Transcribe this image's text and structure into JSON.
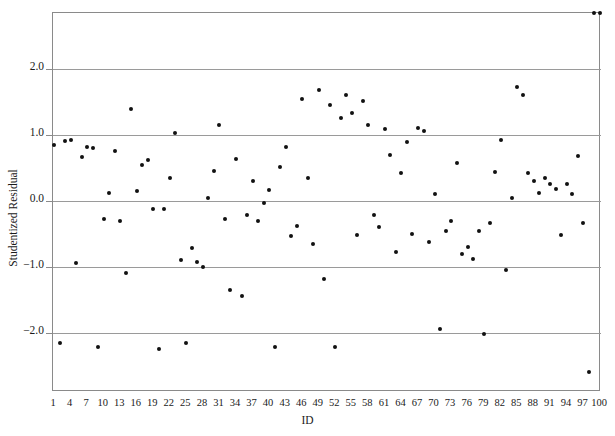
{
  "chart_data": {
    "type": "scatter",
    "title": "",
    "xlabel": "ID",
    "ylabel": "Studentized Residual",
    "xlim": [
      1,
      100
    ],
    "ylim": [
      -2.9,
      2.85
    ],
    "grid": true,
    "gridlines_y": [
      2.0,
      1.0,
      0.0,
      -1.0,
      -2.0
    ],
    "legend": "none",
    "xticks": [
      1,
      4,
      7,
      10,
      13,
      16,
      19,
      22,
      25,
      28,
      31,
      34,
      37,
      40,
      43,
      46,
      49,
      52,
      55,
      58,
      61,
      64,
      67,
      70,
      73,
      76,
      79,
      82,
      85,
      88,
      91,
      94,
      97,
      100
    ],
    "yticks": [
      2.0,
      1.0,
      0.0,
      -1.0,
      -2.0
    ],
    "ytick_labels": [
      "2.0",
      "1.0",
      "0.0",
      "−1.0",
      "−2.0"
    ],
    "marker": "filled-circle",
    "marker_color": "#111111",
    "x": [
      1,
      2,
      3,
      4,
      5,
      6,
      7,
      8,
      9,
      10,
      11,
      12,
      13,
      14,
      15,
      16,
      17,
      18,
      19,
      20,
      21,
      22,
      23,
      24,
      25,
      26,
      27,
      28,
      29,
      30,
      31,
      32,
      33,
      34,
      35,
      36,
      37,
      38,
      39,
      40,
      41,
      42,
      43,
      44,
      45,
      46,
      47,
      48,
      49,
      50,
      51,
      52,
      53,
      54,
      55,
      56,
      57,
      58,
      59,
      60,
      61,
      62,
      63,
      64,
      65,
      66,
      67,
      68,
      69,
      70,
      71,
      72,
      73,
      74,
      75,
      76,
      77,
      78,
      79,
      80,
      81,
      82,
      83,
      84,
      85,
      86,
      87,
      88,
      89,
      90,
      91,
      92,
      93,
      94,
      95,
      96,
      97,
      98,
      99,
      100
    ],
    "y": [
      0.85,
      -2.15,
      0.91,
      0.93,
      -0.95,
      0.66,
      0.82,
      0.8,
      -2.22,
      -0.28,
      0.12,
      0.75,
      -0.3,
      -1.1,
      1.4,
      0.15,
      0.55,
      0.62,
      -0.13,
      -2.25,
      -0.12,
      0.34,
      1.03,
      -0.9,
      -2.15,
      -0.72,
      -0.93,
      -1.0,
      0.05,
      0.46,
      1.15,
      -0.28,
      -1.36,
      0.63,
      -1.45,
      -0.22,
      0.3,
      -0.3,
      -0.03,
      0.16,
      -2.22,
      0.52,
      0.82,
      -0.53,
      -0.38,
      1.55,
      0.35,
      -0.66,
      1.68,
      -1.18,
      1.46,
      -2.22,
      1.25,
      1.6,
      1.34,
      -0.52,
      1.52,
      1.15,
      -0.22,
      -0.4,
      1.09,
      0.7,
      -0.77,
      0.43,
      0.9,
      -0.5,
      1.1,
      1.06,
      -0.63,
      0.1,
      -1.95,
      -0.46,
      -0.3,
      0.58,
      -0.8,
      -0.7,
      -0.88,
      -0.46,
      -2.02,
      -0.34,
      0.44,
      0.92,
      -1.05,
      0.05,
      1.72,
      1.6,
      0.43,
      0.3,
      0.12,
      0.34,
      0.25,
      0.18,
      -0.52,
      0.26,
      0.1,
      0.68,
      -0.33,
      -2.6
    ]
  }
}
